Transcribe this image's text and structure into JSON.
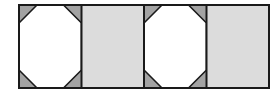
{
  "figure": {
    "type": "geometric-tiling-strip",
    "canvas": {
      "width": 279,
      "height": 108,
      "background_color": "#ffffff"
    },
    "frame": {
      "x": 19,
      "y": 5,
      "width": 250,
      "height": 83,
      "stroke_color": "#1a1a1a",
      "stroke_width": 2,
      "fill_color": "#ffffff"
    },
    "grid": {
      "rows": 1,
      "columns": 4,
      "cell_width": 62.5,
      "cell_height": 83,
      "divider_color": "#1a1a1a",
      "divider_width": 2,
      "divider_x_positions": [
        81.5,
        144,
        206.5
      ]
    },
    "colors": {
      "outline": "#1a1a1a",
      "octagon_fill": "#ffffff",
      "corner_triangle_fill": "#a3a3a3",
      "plain_cell_fill": "#dcdcdc",
      "page_background": "#ffffff"
    },
    "cells": [
      {
        "index": 1,
        "name": "octagon-cell",
        "pattern": "octagon",
        "fill": "#ffffff",
        "corner_fill": "#a3a3a3",
        "corner_cut": 18,
        "x": 19,
        "y": 5,
        "width": 62.5,
        "height": 83
      },
      {
        "index": 2,
        "name": "plain-cell",
        "pattern": "plain",
        "fill": "#dcdcdc",
        "corner_fill": "",
        "corner_cut": 0,
        "x": 81.5,
        "y": 5,
        "width": 62.5,
        "height": 83
      },
      {
        "index": 3,
        "name": "octagon-cell",
        "pattern": "octagon",
        "fill": "#ffffff",
        "corner_fill": "#a3a3a3",
        "corner_cut": 18,
        "x": 144,
        "y": 5,
        "width": 62.5,
        "height": 83
      },
      {
        "index": 4,
        "name": "plain-cell",
        "pattern": "plain",
        "fill": "#dcdcdc",
        "corner_fill": "",
        "corner_cut": 0,
        "x": 206.5,
        "y": 5,
        "width": 62.5,
        "height": 83
      }
    ]
  }
}
